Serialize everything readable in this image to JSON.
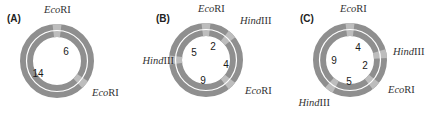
{
  "colors": {
    "ring": "#8f8f8f",
    "site_marker": "#bdbdbd",
    "ring_gap": "#ffffff",
    "text": "#222222"
  },
  "panels": [
    {
      "id": "A",
      "label": "(A)",
      "center": [
        57,
        61
      ],
      "sites": [
        {
          "enzyme_italic": "Eco",
          "enzyme_roman": "RI",
          "angle": 0,
          "label_xy": [
            44,
            13
          ],
          "anchor": "start"
        },
        {
          "enzyme_italic": "Eco",
          "enzyme_roman": "RI",
          "angle": 130,
          "label_xy": [
            92,
            96
          ],
          "anchor": "start"
        }
      ],
      "fragments": [
        {
          "size": "6",
          "xy": [
            66,
            52
          ]
        },
        {
          "size": "14",
          "xy": [
            38,
            74
          ]
        }
      ]
    },
    {
      "id": "B",
      "label": "(B)",
      "center": [
        206,
        60
      ],
      "sites": [
        {
          "enzyme_italic": "Eco",
          "enzyme_roman": "RI",
          "angle": 0,
          "label_xy": [
            198,
            12
          ],
          "anchor": "start"
        },
        {
          "enzyme_italic": "Hind",
          "enzyme_roman": "III",
          "angle": 45,
          "label_xy": [
            240,
            24
          ],
          "anchor": "start"
        },
        {
          "enzyme_italic": "Eco",
          "enzyme_roman": "RI",
          "angle": 135,
          "label_xy": [
            245,
            94
          ],
          "anchor": "start"
        },
        {
          "enzyme_italic": "Hind",
          "enzyme_roman": "III",
          "angle": 270,
          "label_xy": [
            174,
            64
          ],
          "anchor": "end"
        }
      ],
      "fragments": [
        {
          "size": "2",
          "xy": [
            213,
            47
          ]
        },
        {
          "size": "4",
          "xy": [
            226,
            65
          ]
        },
        {
          "size": "9",
          "xy": [
            203,
            81
          ]
        },
        {
          "size": "5",
          "xy": [
            194,
            53
          ]
        }
      ]
    },
    {
      "id": "C",
      "label": "(C)",
      "center": [
        350,
        60
      ],
      "sites": [
        {
          "enzyme_italic": "Eco",
          "enzyme_roman": "RI",
          "angle": 0,
          "label_xy": [
            340,
            12
          ],
          "anchor": "start"
        },
        {
          "enzyme_italic": "Hind",
          "enzyme_roman": "III",
          "angle": 80,
          "label_xy": [
            393,
            55
          ],
          "anchor": "start"
        },
        {
          "enzyme_italic": "Eco",
          "enzyme_roman": "RI",
          "angle": 135,
          "label_xy": [
            388,
            93
          ],
          "anchor": "start"
        },
        {
          "enzyme_italic": "Hind",
          "enzyme_roman": "III",
          "angle": 215,
          "label_xy": [
            330,
            106
          ],
          "anchor": "end"
        }
      ],
      "fragments": [
        {
          "size": "4",
          "xy": [
            358,
            48
          ]
        },
        {
          "size": "2",
          "xy": [
            365,
            66
          ]
        },
        {
          "size": "5",
          "xy": [
            349,
            82
          ]
        },
        {
          "size": "9",
          "xy": [
            334,
            61
          ]
        }
      ]
    }
  ],
  "ring": {
    "outer_radius": 37,
    "inner_radius": 24,
    "gap_radius": 30.5,
    "gap_width": 1.2,
    "site_halfwidth_deg": 7
  }
}
